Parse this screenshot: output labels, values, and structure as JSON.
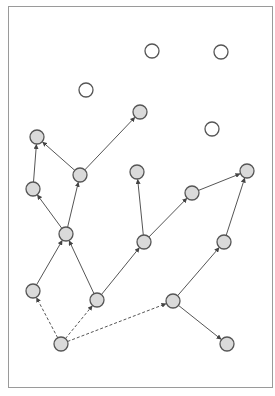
{
  "diagram": {
    "type": "directed-graph",
    "frame": {
      "x": 8.5,
      "y": 6.5,
      "width": 264,
      "height": 381,
      "stroke": "#9a9a9a"
    },
    "style": {
      "node_radius": 7,
      "filled_fill": "#dadada",
      "empty_fill": "#ffffff",
      "node_stroke": "#555555",
      "edge_color": "#555555"
    },
    "nodes": [
      {
        "id": "n1",
        "x": 152,
        "y": 51,
        "filled": false
      },
      {
        "id": "n2",
        "x": 221,
        "y": 52,
        "filled": false
      },
      {
        "id": "n3",
        "x": 86,
        "y": 90,
        "filled": false
      },
      {
        "id": "n4",
        "x": 140,
        "y": 112,
        "filled": true
      },
      {
        "id": "n5",
        "x": 212,
        "y": 129,
        "filled": false
      },
      {
        "id": "n6",
        "x": 37,
        "y": 137,
        "filled": true
      },
      {
        "id": "n7",
        "x": 137,
        "y": 172,
        "filled": true
      },
      {
        "id": "n8",
        "x": 247,
        "y": 171,
        "filled": true
      },
      {
        "id": "n9",
        "x": 80,
        "y": 175,
        "filled": true
      },
      {
        "id": "n10",
        "x": 33,
        "y": 189,
        "filled": true
      },
      {
        "id": "n11",
        "x": 192,
        "y": 193,
        "filled": true
      },
      {
        "id": "n12",
        "x": 66,
        "y": 234,
        "filled": true
      },
      {
        "id": "n13",
        "x": 144,
        "y": 242,
        "filled": true
      },
      {
        "id": "n14",
        "x": 224,
        "y": 242,
        "filled": true
      },
      {
        "id": "n15",
        "x": 33,
        "y": 291,
        "filled": true
      },
      {
        "id": "n16",
        "x": 97,
        "y": 300,
        "filled": true
      },
      {
        "id": "n17",
        "x": 173,
        "y": 301,
        "filled": true
      },
      {
        "id": "n18",
        "x": 61,
        "y": 344,
        "filled": true
      },
      {
        "id": "n19",
        "x": 227,
        "y": 344,
        "filled": true
      }
    ],
    "edges": [
      {
        "from": "n9",
        "to": "n4",
        "dashed": false
      },
      {
        "from": "n9",
        "to": "n6",
        "dashed": false
      },
      {
        "from": "n10",
        "to": "n6",
        "dashed": false
      },
      {
        "from": "n12",
        "to": "n10",
        "dashed": false
      },
      {
        "from": "n12",
        "to": "n9",
        "dashed": false
      },
      {
        "from": "n15",
        "to": "n12",
        "dashed": false
      },
      {
        "from": "n16",
        "to": "n12",
        "dashed": false
      },
      {
        "from": "n16",
        "to": "n13",
        "dashed": false
      },
      {
        "from": "n13",
        "to": "n7",
        "dashed": false
      },
      {
        "from": "n13",
        "to": "n11",
        "dashed": false
      },
      {
        "from": "n11",
        "to": "n8",
        "dashed": false
      },
      {
        "from": "n14",
        "to": "n8",
        "dashed": false
      },
      {
        "from": "n17",
        "to": "n14",
        "dashed": false
      },
      {
        "from": "n17",
        "to": "n19",
        "dashed": false
      },
      {
        "from": "n18",
        "to": "n15",
        "dashed": true
      },
      {
        "from": "n18",
        "to": "n16",
        "dashed": true
      },
      {
        "from": "n18",
        "to": "n17",
        "dashed": true
      }
    ]
  }
}
